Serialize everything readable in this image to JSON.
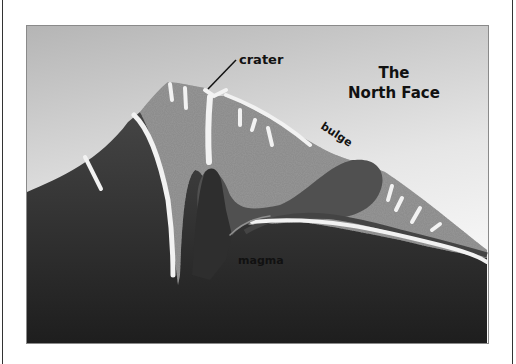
{
  "diagram": {
    "title_line1": "The",
    "title_line2": "North Face",
    "labels": {
      "crater": "crater",
      "bulge": "bulge",
      "magma": "magma"
    },
    "colors": {
      "sky_top": "#b8b8b8",
      "sky_bottom": "#f2f2f2",
      "rock_dark": "#3c3c3c",
      "rock_darkest": "#222222",
      "cone_speckled": "#8c8c8c",
      "bulge_dark": "#505050",
      "dike_white": "#f0f0f0",
      "border": "#8a8a8a"
    }
  }
}
